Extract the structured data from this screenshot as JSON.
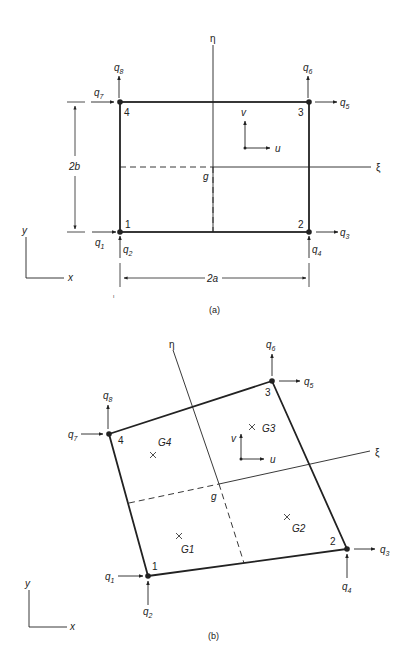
{
  "figure_a": {
    "caption": "(a)",
    "nodes": [
      {
        "id": "1",
        "label": "1",
        "x": 120,
        "y": 232
      },
      {
        "id": "2",
        "label": "2",
        "x": 309,
        "y": 232
      },
      {
        "id": "3",
        "label": "3",
        "x": 308,
        "y": 102
      },
      {
        "id": "4",
        "label": "4",
        "x": 119,
        "y": 102
      }
    ],
    "dofs": [
      {
        "q": "q",
        "sub": "1"
      },
      {
        "q": "q",
        "sub": "2"
      },
      {
        "q": "q",
        "sub": "3"
      },
      {
        "q": "q",
        "sub": "4"
      },
      {
        "q": "q",
        "sub": "5"
      },
      {
        "q": "q",
        "sub": "6"
      },
      {
        "q": "q",
        "sub": "7"
      },
      {
        "q": "q",
        "sub": "8"
      }
    ],
    "eta_label": "η",
    "xi_label": "ξ",
    "center_label": "g",
    "u_label": "u",
    "v_label": "v",
    "dim_height_label": "2b",
    "dim_width_label": "2a",
    "axis_x_label": "x",
    "axis_y_label": "y"
  },
  "figure_b": {
    "caption": "(b)",
    "nodes": [
      {
        "id": "1",
        "label": "1",
        "x": 148,
        "y": 576
      },
      {
        "id": "2",
        "label": "2",
        "x": 347,
        "y": 549
      },
      {
        "id": "3",
        "label": "3",
        "x": 272,
        "y": 381
      },
      {
        "id": "4",
        "label": "4",
        "x": 109,
        "y": 434
      }
    ],
    "dofs": [
      {
        "q": "q",
        "sub": "1"
      },
      {
        "q": "q",
        "sub": "2"
      },
      {
        "q": "q",
        "sub": "3"
      },
      {
        "q": "q",
        "sub": "4"
      },
      {
        "q": "q",
        "sub": "5"
      },
      {
        "q": "q",
        "sub": "6"
      },
      {
        "q": "q",
        "sub": "7"
      },
      {
        "q": "q",
        "sub": "8"
      }
    ],
    "gauss_points": [
      {
        "label": "G1"
      },
      {
        "label": "G2"
      },
      {
        "label": "G3"
      },
      {
        "label": "G4"
      }
    ],
    "eta_label": "η",
    "xi_label": "ξ",
    "center_label": "g",
    "u_label": "u",
    "v_label": "v",
    "axis_x_label": "x",
    "axis_y_label": "y"
  },
  "colors": {
    "stroke": "#222222",
    "background": "#ffffff"
  }
}
